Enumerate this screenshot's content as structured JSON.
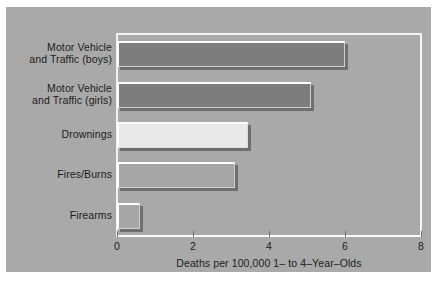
{
  "chart_data": {
    "type": "bar",
    "orientation": "horizontal",
    "title": "",
    "xlabel": "Deaths per 100,000 1– to 4–Year–Olds",
    "ylabel": "",
    "xlim": [
      0,
      8
    ],
    "xticks": [
      0,
      2,
      4,
      6,
      8
    ],
    "xtick_labels": [
      "0",
      "2",
      "4",
      "6",
      "8"
    ],
    "grid": false,
    "legend": null,
    "categories": [
      "Motor Vehicle and Traffic (boys)",
      "Motor Vehicle and Traffic (girls)",
      "Drownings",
      "Fires/Burns",
      "Firearms"
    ],
    "category_lines": [
      [
        "Motor Vehicle",
        "and Traffic (boys)"
      ],
      [
        "Motor Vehicle",
        "and Traffic (girls)"
      ],
      [
        "Drownings"
      ],
      [
        "Fires/Burns"
      ],
      [
        "Firearms"
      ]
    ],
    "values": [
      6.0,
      5.1,
      3.45,
      3.1,
      0.6
    ],
    "bar_styles": [
      "dark",
      "dark",
      "light",
      "medium",
      "medium"
    ],
    "bar_fill_colors": [
      "#7d7d7d",
      "#7d7d7d",
      "#e9e9e9",
      "#a6a6a6",
      "#a6a6a6"
    ]
  },
  "colors": {
    "panel_background": "#a9a9a9",
    "figure_background": "#ffffff",
    "frame": "#f2f2f2",
    "text": "#1c1c1c",
    "tick": "#6f6f6f",
    "bar_highlight": "#ffffff",
    "bar_shadow": "#282828"
  }
}
